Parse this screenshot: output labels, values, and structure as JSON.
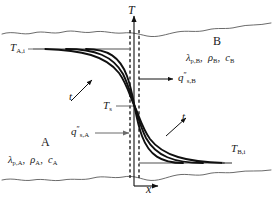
{
  "figure": {
    "axes": {
      "vertical_label": "T",
      "horizontal_label": "x"
    },
    "regions": {
      "upper": {
        "name": "B",
        "properties_lambda": "λ",
        "properties_lambda_sub": "p,B",
        "properties_rho": "ρ",
        "properties_rho_sub": "B",
        "properties_c": "c",
        "properties_c_sub": "B",
        "initial_temp_symbol": "T",
        "initial_temp_sub": "B,i"
      },
      "lower": {
        "name": "A",
        "properties_lambda": "λ",
        "properties_lambda_sub": "p,A",
        "properties_rho": "ρ",
        "properties_rho_sub": "A",
        "properties_c": "c",
        "properties_c_sub": "A",
        "initial_temp_symbol": "T",
        "initial_temp_sub": "A,i"
      }
    },
    "interface": {
      "surface_temp_symbol": "T",
      "surface_temp_sub": "s"
    },
    "fluxes": {
      "into_B": {
        "symbol": "q",
        "prime": "″",
        "sub": "s,B"
      },
      "out_of_A": {
        "symbol": "q",
        "prime": "″",
        "sub": "s,A"
      }
    },
    "time_arrows": {
      "upper_left_label": "t",
      "lower_right_label": "t"
    },
    "colors": {
      "curve": "#101010",
      "axis": "#101010",
      "guide": "#6b6b6b",
      "boundary": "#5a5a5a",
      "background": "#ffffff"
    },
    "curve_count": 3
  }
}
